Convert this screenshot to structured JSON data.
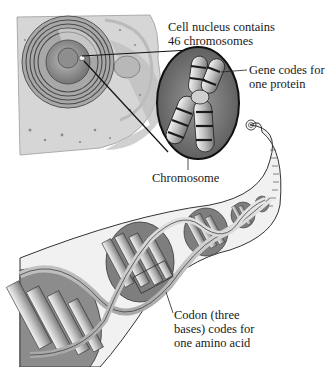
{
  "diagram": {
    "type": "biology-illustration",
    "labels": {
      "nucleus_line1": "Cell nucleus contains",
      "nucleus_line2": "46 chromosomes",
      "gene_line1": "Gene codes for",
      "gene_line2": "one protein",
      "chromosome": "Chromosome",
      "codon_line1": "Codon (three",
      "codon_line2": "bases) codes for",
      "codon_line3": "one amino acid"
    },
    "parts": [
      "cell",
      "nucleus",
      "chromosome-magnifier",
      "dna-ribbon",
      "double-helix",
      "codon-box"
    ],
    "colors": {
      "cell_fill": "#d8d8d8",
      "nucleus_fill": "#9a9a9a",
      "magnifier_fill": "#7a7a7a",
      "helix_light": "#e6e6e6",
      "helix_dark": "#5a5a5a",
      "outline": "#222222"
    }
  }
}
